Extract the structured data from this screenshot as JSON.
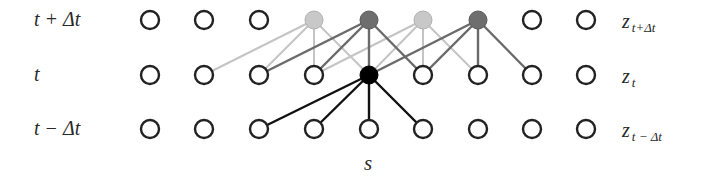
{
  "diagram": {
    "rows": [
      {
        "id": "top",
        "time_label": "t + Δt",
        "z_label": "z",
        "z_sub": "t+Δt",
        "y": 20
      },
      {
        "id": "mid",
        "time_label": "t",
        "z_label": "z",
        "z_sub": "t",
        "y": 75
      },
      {
        "id": "bottom",
        "time_label": "t − Δt",
        "z_label": "z",
        "z_sub": "t − Δt",
        "y": 129
      }
    ],
    "columns_x": [
      150,
      204,
      259,
      314,
      369,
      423,
      478,
      532,
      586
    ],
    "axis_label": "s",
    "node_radius": 9,
    "colors": {
      "empty_stroke": "#222222",
      "light_fill": "#c8c8c8",
      "light_edge": "#c4c4c4",
      "dark_fill": "#6e6e6e",
      "dark_edge": "#6a6a6a",
      "center_fill": "#000000",
      "center_edge": "#111111"
    },
    "special_nodes": [
      {
        "row": 0,
        "col": 3,
        "type": "light"
      },
      {
        "row": 0,
        "col": 4,
        "type": "dark"
      },
      {
        "row": 0,
        "col": 5,
        "type": "light"
      },
      {
        "row": 0,
        "col": 6,
        "type": "dark"
      },
      {
        "row": 1,
        "col": 4,
        "type": "center"
      }
    ],
    "edges": [
      {
        "from": [
          0,
          3
        ],
        "to": [
          [
            1,
            1
          ],
          [
            1,
            2
          ],
          [
            1,
            3
          ],
          [
            1,
            4
          ]
        ],
        "type": "light"
      },
      {
        "from": [
          0,
          5
        ],
        "to": [
          [
            1,
            3
          ],
          [
            1,
            4
          ],
          [
            1,
            5
          ],
          [
            1,
            6
          ]
        ],
        "type": "light"
      },
      {
        "from": [
          0,
          4
        ],
        "to": [
          [
            1,
            2
          ],
          [
            1,
            3
          ],
          [
            1,
            4
          ],
          [
            1,
            5
          ]
        ],
        "type": "dark"
      },
      {
        "from": [
          0,
          6
        ],
        "to": [
          [
            1,
            4
          ],
          [
            1,
            5
          ],
          [
            1,
            6
          ],
          [
            1,
            7
          ]
        ],
        "type": "dark"
      },
      {
        "from": [
          1,
          4
        ],
        "to": [
          [
            2,
            2
          ],
          [
            2,
            3
          ],
          [
            2,
            4
          ],
          [
            2,
            5
          ]
        ],
        "type": "center"
      }
    ]
  }
}
